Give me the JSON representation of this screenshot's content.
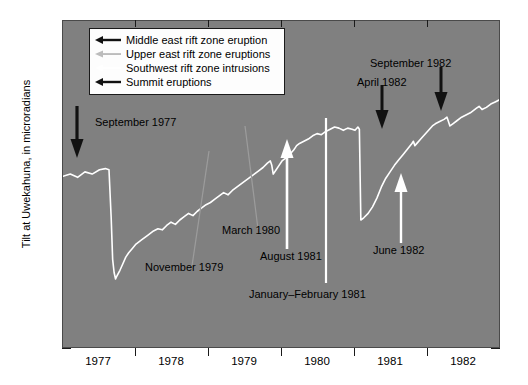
{
  "chart_data": {
    "type": "line",
    "title": "",
    "xlabel": "",
    "ylabel": "Tilt at Uwekahuna, in microradians",
    "xlim": [
      1977.0,
      1983.0
    ],
    "ylim": [
      -100,
      200
    ],
    "ytick_labels": [
      "200",
      "100",
      "0",
      "100"
    ],
    "ytick_values": [
      200,
      100,
      0,
      -100
    ],
    "y_minor_interval": 10,
    "xtick_labels": [
      "1977",
      "1978",
      "1979",
      "1980",
      "1981",
      "1982"
    ],
    "xtick_values": [
      1977,
      1978,
      1979,
      1980,
      1981,
      1982
    ],
    "grid": false,
    "legend_position": "upper-left-inside",
    "plot_background": "#808080",
    "series_color": "#ffffff",
    "legend": [
      {
        "label": "Middle east rift zone eruption",
        "arrow_color": "#111111"
      },
      {
        "label": "Upper east rift zone eruptions",
        "arrow_color": "#b9b9b9"
      },
      {
        "label": "Southwest rift zone intrusions",
        "arrow_color": "#ffffff"
      },
      {
        "label": "Summit eruptions",
        "arrow_color": "#111111"
      }
    ],
    "series": [
      {
        "name": "Tilt at Uwekahuna",
        "x": [
          1977.0,
          1977.1,
          1977.2,
          1977.3,
          1977.4,
          1977.5,
          1977.58,
          1977.63,
          1977.66,
          1977.68,
          1977.7,
          1977.72,
          1977.74,
          1977.78,
          1977.82,
          1977.86,
          1977.9,
          1977.95,
          1978.0,
          1978.08,
          1978.16,
          1978.24,
          1978.3,
          1978.36,
          1978.42,
          1978.48,
          1978.54,
          1978.6,
          1978.66,
          1978.72,
          1978.78,
          1978.84,
          1978.9,
          1978.96,
          1979.02,
          1979.08,
          1979.14,
          1979.2,
          1979.26,
          1979.32,
          1979.38,
          1979.44,
          1979.5,
          1979.56,
          1979.62,
          1979.68,
          1979.74,
          1979.8,
          1979.84,
          1979.86,
          1979.88,
          1979.92,
          1979.96,
          1980.0,
          1980.06,
          1980.12,
          1980.16,
          1980.18,
          1980.2,
          1980.24,
          1980.3,
          1980.36,
          1980.42,
          1980.48,
          1980.54,
          1980.6,
          1980.66,
          1980.72,
          1980.78,
          1980.84,
          1980.9,
          1980.96,
          1981.0,
          1981.04,
          1981.06,
          1981.08,
          1981.12,
          1981.18,
          1981.24,
          1981.3,
          1981.36,
          1981.42,
          1981.48,
          1981.54,
          1981.6,
          1981.66,
          1981.72,
          1981.78,
          1981.8,
          1981.82,
          1981.86,
          1981.9,
          1981.94,
          1981.98,
          1982.02,
          1982.06,
          1982.1,
          1982.16,
          1982.22,
          1982.26,
          1982.28,
          1982.3,
          1982.34,
          1982.4,
          1982.46,
          1982.52,
          1982.58,
          1982.62,
          1982.66,
          1982.7,
          1982.74,
          1982.8,
          1982.86,
          1982.92,
          1982.98
        ],
        "y": [
          58,
          60,
          57,
          62,
          60,
          64,
          65,
          64,
          20,
          -18,
          -30,
          -36,
          -33,
          -28,
          -22,
          -16,
          -12,
          -8,
          -4,
          0,
          4,
          8,
          10,
          9,
          13,
          16,
          14,
          18,
          21,
          24,
          22,
          26,
          29,
          32,
          34,
          37,
          40,
          43,
          41,
          45,
          48,
          51,
          54,
          57,
          60,
          63,
          66,
          70,
          72,
          68,
          60,
          64,
          68,
          72,
          75,
          79,
          82,
          84,
          86,
          88,
          90,
          92,
          95,
          97,
          96,
          99,
          101,
          103,
          102,
          100,
          102,
          101,
          100,
          103,
          101,
          18,
          20,
          24,
          30,
          38,
          48,
          56,
          62,
          68,
          73,
          78,
          83,
          88,
          90,
          86,
          89,
          92,
          95,
          98,
          101,
          104,
          106,
          108,
          110,
          112,
          108,
          104,
          106,
          109,
          112,
          114,
          116,
          118,
          120,
          122,
          119,
          121,
          124,
          126,
          128
        ]
      }
    ],
    "annotations": [
      {
        "label": "September 1977",
        "arrow": "down",
        "arrow_color": "#111111",
        "text_color": "#000000"
      },
      {
        "label": "November 1979",
        "arrow": "none",
        "arrow_color": "#9a9a9a",
        "text_color": "#000000"
      },
      {
        "label": "March 1980",
        "arrow": "none",
        "arrow_color": "#9a9a9a",
        "text_color": "#000000"
      },
      {
        "label": "January–February 1981",
        "arrow": "none",
        "arrow_color": "#ffffff",
        "text_color": "#000000"
      },
      {
        "label": "August 1981",
        "arrow": "up",
        "arrow_color": "#ffffff",
        "text_color": "#000000"
      },
      {
        "label": "April 1982",
        "arrow": "down",
        "arrow_color": "#111111",
        "text_color": "#000000"
      },
      {
        "label": "September 1982",
        "arrow": "down",
        "arrow_color": "#111111",
        "text_color": "#000000"
      },
      {
        "label": "June 1982",
        "arrow": "up",
        "arrow_color": "#ffffff",
        "text_color": "#000000"
      }
    ]
  }
}
